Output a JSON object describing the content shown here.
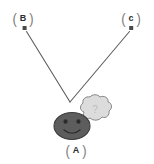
{
  "diagram": {
    "canvas": {
      "width": 154,
      "height": 164,
      "background": "#ffffff"
    },
    "nodes": [
      {
        "id": "a",
        "label": "A",
        "open_bracket": "(",
        "close_bracket": ")",
        "role": "source-actor",
        "x": 62,
        "y": 142
      },
      {
        "id": "b",
        "label": "B",
        "open_bracket": "(",
        "close_bracket": ")",
        "role": "outcome-left",
        "x": 10,
        "y": 10
      },
      {
        "id": "c",
        "label": "c",
        "open_bracket": "(",
        "close_bracket": ")",
        "role": "outcome-right",
        "x": 118,
        "y": 10
      }
    ],
    "arrows": [
      {
        "id": "arrow-a-to-b",
        "from": "A",
        "to": "B",
        "start": {
          "x": 70,
          "y": 102
        },
        "end": {
          "x": 25,
          "y": 30
        },
        "color": "#5e5e5e",
        "stroke_width": 1.1,
        "head": "square-dot"
      },
      {
        "id": "arrow-a-to-c",
        "from": "A",
        "to": "c",
        "start": {
          "x": 70,
          "y": 102
        },
        "end": {
          "x": 131,
          "y": 30
        },
        "color": "#5e5e5e",
        "stroke_width": 1.1,
        "head": "square-dot"
      }
    ],
    "face": {
      "id": "smiley-face",
      "description": "dark gray ellipse face with two eyes and a smile",
      "fill": "#5d5d5d",
      "stroke": "#3a3a3a",
      "center": {
        "x": 72,
        "y": 126
      },
      "radius_x": 18,
      "radius_y": 14,
      "eyes": [
        {
          "x": 66,
          "y": 122
        },
        {
          "x": 79,
          "y": 122
        }
      ],
      "mouth": "smile"
    },
    "thought_bubble": {
      "id": "thought-cloud",
      "description": "light gray cloud-shaped thought bubble",
      "fill": "#dcdcdc",
      "stroke": "#7a7a7a",
      "center": {
        "x": 94,
        "y": 110
      },
      "content": "?",
      "tail_dots": [
        {
          "x": 80,
          "y": 120,
          "r": 2.2
        },
        {
          "x": 77,
          "y": 124,
          "r": 1.3
        }
      ]
    },
    "colors": {
      "line": "#5e5e5e",
      "face_fill": "#5d5d5d",
      "face_stroke": "#3a3a3a",
      "cloud_fill": "#dcdcdc",
      "cloud_stroke": "#7a7a7a",
      "label_text": "#2e2e2e",
      "bracket": "#7b7b7b",
      "background": "#ffffff"
    }
  }
}
